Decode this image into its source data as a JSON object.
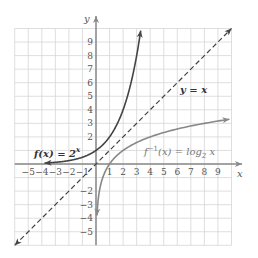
{
  "chart_data": {
    "type": "line",
    "title": "",
    "xlabel": "x",
    "ylabel": "y",
    "xlim": [
      -6,
      10
    ],
    "ylim": [
      -6,
      10
    ],
    "grid": true,
    "x_ticks": [
      "-5",
      "-4",
      "-3",
      "-2",
      "-1",
      "1",
      "2",
      "3",
      "4",
      "5",
      "6",
      "7",
      "8",
      "9"
    ],
    "y_ticks": [
      "9",
      "8",
      "7",
      "6",
      "5",
      "4",
      "3",
      "2",
      "-2",
      "-3",
      "-4",
      "-5"
    ],
    "series": [
      {
        "name": "f(x) = 2^x",
        "label_main": "f(x) = 2",
        "label_sup": "x",
        "color": "#444444",
        "style": "solid",
        "x": [
          -3.8,
          -3,
          -2,
          -1,
          0,
          1,
          2,
          3,
          3.3
        ],
        "y": [
          0.07,
          0.125,
          0.25,
          0.5,
          1,
          2,
          4,
          8,
          9.8
        ]
      },
      {
        "name": "f^-1(x) = log2 x",
        "label_main": "f",
        "label_sup": "−1",
        "label_rest": "(x) = log",
        "label_sub": "2",
        "label_end": " x",
        "color": "#888888",
        "style": "solid",
        "x": [
          0.07,
          0.125,
          0.25,
          0.5,
          1,
          2,
          4,
          8,
          9.8
        ],
        "y": [
          -3.8,
          -3,
          -2,
          -1,
          0,
          1,
          2,
          3,
          3.3
        ]
      },
      {
        "name": "y = x",
        "label": "y = x",
        "color": "#444444",
        "style": "dashed",
        "x": [
          -6,
          10
        ],
        "y": [
          -6,
          10
        ]
      }
    ]
  }
}
